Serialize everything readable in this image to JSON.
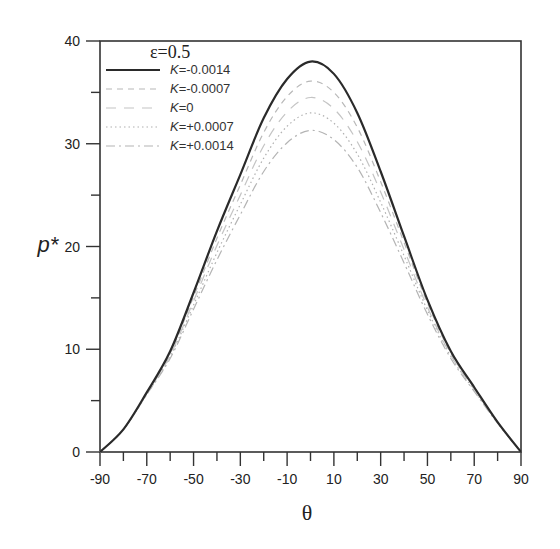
{
  "chart_data": {
    "type": "line",
    "title": "",
    "annotation": "ε=0.5",
    "xlabel": "θ",
    "ylabel": "p*",
    "xlim": [
      -90,
      90
    ],
    "ylim": [
      0,
      40
    ],
    "grid": false,
    "legend_position": "upper-left",
    "x_ticks": [
      -90,
      -70,
      -50,
      -30,
      -10,
      10,
      30,
      50,
      70,
      90
    ],
    "x_minor_ticks": [
      -80,
      -60,
      -40,
      -20,
      0,
      20,
      40,
      60,
      80
    ],
    "y_ticks": [
      0,
      10,
      20,
      30,
      40
    ],
    "y_minor_ticks": [
      5,
      15,
      25,
      35
    ],
    "x": [
      -90,
      -80,
      -70,
      -60,
      -50,
      -40,
      -30,
      -20,
      -10,
      0,
      10,
      20,
      30,
      40,
      50,
      60,
      70,
      80,
      90
    ],
    "series": [
      {
        "name": "K=-0.0014",
        "label_k": "K",
        "label_rest": "=-0.0014",
        "style": "solid",
        "color": "#2a2a2a",
        "width": 2.2,
        "values": [
          0,
          2.2,
          5.8,
          9.8,
          15.5,
          21.5,
          27.0,
          32.5,
          36.3,
          38.0,
          36.8,
          33.0,
          27.3,
          21.0,
          14.8,
          9.8,
          6.3,
          2.9,
          0
        ]
      },
      {
        "name": "K=-0.0007",
        "label_k": "K",
        "label_rest": "=-0.0007",
        "style": "dashed",
        "color": "#b8b8b8",
        "width": 1.2,
        "values": [
          0,
          2.2,
          5.7,
          9.6,
          15.1,
          20.8,
          26.0,
          31.1,
          34.6,
          36.1,
          35.0,
          31.6,
          26.3,
          20.4,
          14.5,
          9.6,
          6.2,
          2.9,
          0
        ]
      },
      {
        "name": "K=0",
        "label_k": "K",
        "label_rest": "=0",
        "style": "longdash",
        "color": "#c4c4c4",
        "width": 1.2,
        "values": [
          0,
          2.2,
          5.7,
          9.4,
          14.7,
          20.1,
          25.0,
          29.8,
          33.1,
          34.5,
          33.4,
          30.2,
          25.3,
          19.7,
          14.1,
          9.4,
          6.1,
          2.9,
          0
        ]
      },
      {
        "name": "K=+0.0007",
        "label_k": "K",
        "label_rest": "=+0.0007",
        "style": "dotted",
        "color": "#b0b0b0",
        "width": 1.2,
        "values": [
          0,
          2.2,
          5.6,
          9.3,
          14.3,
          19.4,
          24.1,
          28.6,
          31.7,
          33.0,
          32.0,
          29.0,
          24.3,
          19.1,
          13.8,
          9.3,
          6.0,
          2.8,
          0
        ]
      },
      {
        "name": "K=+0.0014",
        "label_k": "K",
        "label_rest": "=+0.0014",
        "style": "dashdot",
        "color": "#b4b4b4",
        "width": 1.2,
        "values": [
          0,
          2.2,
          5.6,
          9.1,
          13.9,
          18.7,
          23.1,
          27.3,
          30.1,
          31.3,
          30.4,
          27.7,
          23.3,
          18.4,
          13.4,
          9.1,
          5.9,
          2.8,
          0
        ]
      }
    ]
  }
}
